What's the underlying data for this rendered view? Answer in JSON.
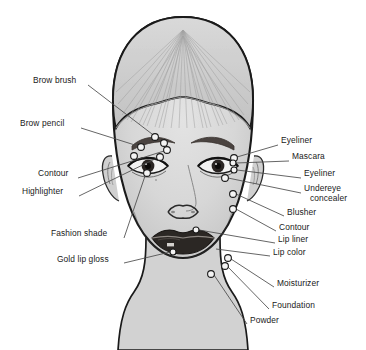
{
  "diagram": {
    "marker_style": "small open circles",
    "colors": {
      "skin": "#d6d6d6",
      "hair": "#c9c9c9",
      "outline": "#1a1a1a",
      "brow": "#4a4340",
      "lips": "#2b2724",
      "leader_line": "#4a4a4a",
      "text": "#1a1a1a",
      "background": "#ffffff"
    },
    "labels_left": [
      {
        "id": "brow-brush",
        "text": "Brow brush",
        "x": 33,
        "y": 80,
        "lx": 88,
        "ly": 85,
        "tx": 155,
        "ty": 137
      },
      {
        "id": "brow-pencil",
        "text": "Brow pencil",
        "x": 20,
        "y": 123,
        "lx": 81,
        "ly": 128,
        "tx": 141,
        "ty": 147
      },
      {
        "id": "contour",
        "text": "Contour",
        "x": 38,
        "y": 173,
        "lx": 78,
        "ly": 178,
        "tx": 167,
        "ty": 150
      },
      {
        "id": "highlighter",
        "text": "Highlighter",
        "x": 22,
        "y": 191,
        "lx": 79,
        "ly": 196,
        "tx": 160,
        "ty": 157
      },
      {
        "id": "fashion-shade",
        "text": "Fashion shade",
        "x": 51,
        "y": 233,
        "lx": 124,
        "ly": 238,
        "tx": 147,
        "ty": 173
      },
      {
        "id": "gold-lip-gloss",
        "text": "Gold lip gloss",
        "x": 57,
        "y": 259,
        "lx": 124,
        "ly": 263,
        "tx": 171,
        "ty": 252
      }
    ],
    "labels_right": [
      {
        "id": "eyeliner-upper",
        "text": "Eyeliner",
        "x": 281,
        "y": 140,
        "lx": 278,
        "ly": 145,
        "tx": 234,
        "ty": 158
      },
      {
        "id": "mascara",
        "text": "Mascara",
        "x": 292,
        "y": 156,
        "lx": 289,
        "ly": 161,
        "tx": 233,
        "ty": 163
      },
      {
        "id": "eyeliner-lower",
        "text": "Eyeliner",
        "x": 304,
        "y": 173,
        "lx": 301,
        "ly": 178,
        "tx": 234,
        "ty": 170
      },
      {
        "id": "undereye-concealer",
        "text": "Undereye",
        "x": 304,
        "y": 188,
        "lx": 301,
        "ly": 193,
        "tx": 225,
        "ty": 178
      },
      {
        "id": "undereye-concealer2",
        "text": "concealer",
        "x": 310,
        "y": 198,
        "lx": null,
        "ly": null,
        "tx": null,
        "ty": null
      },
      {
        "id": "blusher",
        "text": "Blusher",
        "x": 287,
        "y": 212,
        "lx": 284,
        "ly": 216,
        "tx": 233,
        "ty": 194
      },
      {
        "id": "contour-r",
        "text": "Contour",
        "x": 279,
        "y": 227,
        "lx": 276,
        "ly": 231,
        "tx": 233,
        "ty": 209
      },
      {
        "id": "lip-liner",
        "text": "Lip liner",
        "x": 278,
        "y": 239,
        "lx": 275,
        "ly": 243,
        "tx": 196,
        "ty": 230
      },
      {
        "id": "lip-color",
        "text": "Lip color",
        "x": 273,
        "y": 252,
        "lx": 270,
        "ly": 256,
        "tx": 213,
        "ty": 248
      },
      {
        "id": "moisturizer",
        "text": "Moisturizer",
        "x": 277,
        "y": 283,
        "lx": 274,
        "ly": 287,
        "tx": 228,
        "ty": 258
      },
      {
        "id": "foundation",
        "text": "Foundation",
        "x": 272,
        "y": 305,
        "lx": 269,
        "ly": 309,
        "tx": 225,
        "ty": 266
      },
      {
        "id": "powder",
        "text": "Powder",
        "x": 250,
        "y": 320,
        "lx": 247,
        "ly": 324,
        "tx": 211,
        "ty": 274
      }
    ],
    "markers": [
      {
        "id": "marker-brow-brush",
        "cx": 155,
        "cy": 137,
        "r": 3.4
      },
      {
        "id": "marker-brow-pencil",
        "cx": 141,
        "cy": 147,
        "r": 3.4
      },
      {
        "id": "marker-brow-arch",
        "cx": 164,
        "cy": 143,
        "r": 3.4
      },
      {
        "id": "marker-contour-l",
        "cx": 167,
        "cy": 150,
        "r": 3.4
      },
      {
        "id": "marker-highlighter-l",
        "cx": 160,
        "cy": 157,
        "r": 3.4
      },
      {
        "id": "marker-lid-inner",
        "cx": 134,
        "cy": 156,
        "r": 3.4
      },
      {
        "id": "marker-fashion-shade",
        "cx": 147,
        "cy": 173,
        "r": 3.4
      },
      {
        "id": "marker-eyeliner-upper",
        "cx": 234,
        "cy": 158,
        "r": 3.4
      },
      {
        "id": "marker-mascara",
        "cx": 233,
        "cy": 163,
        "r": 3.0
      },
      {
        "id": "marker-eyeliner-lower",
        "cx": 234,
        "cy": 170,
        "r": 3.0
      },
      {
        "id": "marker-undereye",
        "cx": 225,
        "cy": 178,
        "r": 3.4
      },
      {
        "id": "marker-blusher",
        "cx": 233,
        "cy": 194,
        "r": 3.4
      },
      {
        "id": "marker-contour-r",
        "cx": 233,
        "cy": 209,
        "r": 3.4
      },
      {
        "id": "marker-lip-liner",
        "cx": 196,
        "cy": 230,
        "r": 3.0
      },
      {
        "id": "marker-lip-color",
        "cx": 173,
        "cy": 252,
        "r": 3.0
      },
      {
        "id": "marker-moisturizer",
        "cx": 228,
        "cy": 258,
        "r": 3.4
      },
      {
        "id": "marker-foundation",
        "cx": 225,
        "cy": 266,
        "r": 3.4
      },
      {
        "id": "marker-powder",
        "cx": 211,
        "cy": 274,
        "r": 3.4
      }
    ]
  }
}
